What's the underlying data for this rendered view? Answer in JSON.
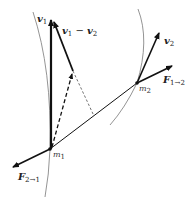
{
  "diagram": {
    "labels": {
      "v1": {
        "main": "v",
        "sub": "1"
      },
      "v1_minus_v2": {
        "main1": "v",
        "sub1": "1",
        "op": " − ",
        "main2": "v",
        "sub2": "2"
      },
      "v2": {
        "main": "v",
        "sub": "2"
      },
      "F12": {
        "main": "F",
        "sub": "1→2"
      },
      "F21": {
        "main": "F",
        "sub": "2→1"
      },
      "m1": {
        "main": "m",
        "sub": "1"
      },
      "m2": {
        "main": "m",
        "sub": "2"
      }
    },
    "points": {
      "m1": [
        50,
        149
      ],
      "m2": [
        137,
        83
      ]
    },
    "colors": {
      "arrow": "#111111",
      "curve": "#777777"
    }
  }
}
